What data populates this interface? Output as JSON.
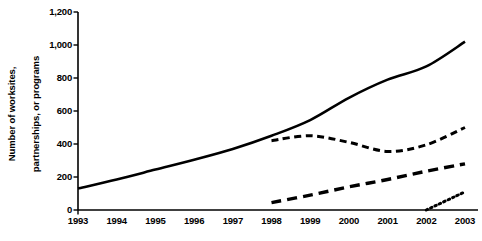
{
  "chart_data": {
    "type": "line",
    "title": "",
    "xlabel": "",
    "ylabel": "Number of worksites, partnerships, or programs",
    "ylabel_line1": "Number of worksites,",
    "ylabel_line2": "partnerships, or programs",
    "x": [
      1993,
      1994,
      1995,
      1996,
      1997,
      1998,
      1999,
      2000,
      2001,
      2002,
      2003
    ],
    "categories": [
      "1993",
      "1994",
      "1995",
      "1996",
      "1997",
      "1998",
      "1999",
      "2000",
      "2001",
      "2002",
      "2003"
    ],
    "xlim": [
      1993,
      2003
    ],
    "ylim": [
      0,
      1200
    ],
    "yticks": [
      0,
      200,
      400,
      600,
      800,
      1000,
      1200
    ],
    "ytick_labels": [
      "0",
      "200",
      "400",
      "600",
      "800",
      "1,000",
      "1,200"
    ],
    "grid": false,
    "legend": "none",
    "series": [
      {
        "name": "worksites",
        "style": "solid",
        "color": "#000000",
        "x": [
          1993,
          1994,
          1995,
          1996,
          1997,
          1998,
          1999,
          2000,
          2001,
          2002,
          2003
        ],
        "values": [
          130,
          185,
          245,
          305,
          370,
          450,
          545,
          680,
          790,
          870,
          1020
        ]
      },
      {
        "name": "partnerships",
        "style": "long-dash",
        "color": "#000000",
        "x": [
          1998,
          1999,
          2000,
          2001,
          2002,
          2003
        ],
        "values": [
          420,
          450,
          410,
          355,
          395,
          500
        ]
      },
      {
        "name": "programs",
        "style": "dash",
        "color": "#000000",
        "x": [
          1998,
          1999,
          2000,
          2001,
          2002,
          2003
        ],
        "values": [
          45,
          90,
          140,
          185,
          235,
          280
        ]
      },
      {
        "name": "new-initiatives",
        "style": "dotted",
        "color": "#000000",
        "x": [
          2002,
          2003
        ],
        "values": [
          0,
          110
        ]
      }
    ]
  },
  "axes": {
    "tick_color": "#000000",
    "axis_color": "#000000"
  }
}
